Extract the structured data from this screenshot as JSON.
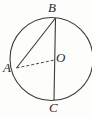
{
  "figure": {
    "width": 92,
    "height": 118,
    "background_color": "#fdfdfc",
    "stroke_color": "#3a3a3a",
    "label_color": "#2b2b2b",
    "circle": {
      "name": "circle",
      "center_x": 51.5,
      "center_y": 59,
      "radius": 41.5,
      "stroke_width": 1.1,
      "fill": "none",
      "clipped_right_edge": true
    },
    "points": [
      {
        "id": "B",
        "label": "B",
        "x": 55.5,
        "y": 18.0,
        "role": "top-of-diameter"
      },
      {
        "id": "A",
        "label": "A",
        "x": 16.5,
        "y": 68.0,
        "role": "point-on-circle"
      },
      {
        "id": "O",
        "label": "O",
        "x": 54.5,
        "y": 59.5,
        "role": "center"
      },
      {
        "id": "C",
        "label": "C",
        "x": 54.0,
        "y": 100.0,
        "role": "bottom-of-diameter"
      }
    ],
    "segments": [
      {
        "id": "BC",
        "from": "B",
        "to": "C",
        "style": "solid",
        "description": "vertical diameter from B to C"
      },
      {
        "id": "AB",
        "from": "A",
        "to": "B",
        "style": "solid",
        "description": "chord from A to B"
      },
      {
        "id": "AO",
        "from": "A",
        "to": "O",
        "style": "dashed",
        "dash_pattern": "3 2",
        "description": "dashed radius from A to center O"
      }
    ],
    "labels": {
      "B": "B",
      "A": "A",
      "O": "O",
      "C": "C"
    }
  }
}
